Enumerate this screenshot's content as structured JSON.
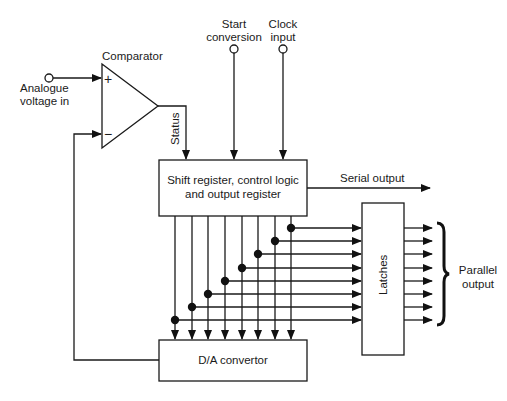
{
  "diagram": {
    "inputs": {
      "analogue": {
        "line1": "Analogue",
        "line2": "voltage in"
      },
      "start": {
        "line1": "Start",
        "line2": "conversion"
      },
      "clock": {
        "line1": "Clock",
        "line2": "input"
      }
    },
    "comparator": {
      "label": "Comparator",
      "plus": "+",
      "minus": "−",
      "status_label": "Status"
    },
    "blocks": {
      "shift_register": {
        "line1": "Shift register, control logic",
        "line2": "and output register"
      },
      "dac": {
        "label": "D/A convertor"
      },
      "latches": {
        "label": "Latches"
      }
    },
    "outputs": {
      "serial": "Serial output",
      "parallel": {
        "line1": "Parallel",
        "line2": "output"
      }
    },
    "bits": 8,
    "colors": {
      "stroke": "#1a1a1a",
      "background": "#ffffff"
    }
  }
}
